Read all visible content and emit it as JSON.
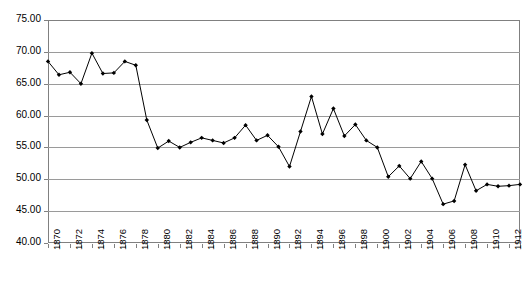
{
  "chart_data": {
    "type": "line",
    "title": "",
    "subtitle": "",
    "xlabel": "",
    "ylabel": "",
    "grid": true,
    "legend": false,
    "legend_position": "none",
    "marker": "filled-diamond",
    "line_color": "#000000",
    "marker_color": "#000000",
    "grid_color": "#9a9a9a",
    "background_color": "#ffffff",
    "xlim": [
      1870,
      1913
    ],
    "ylim": [
      40.0,
      75.0
    ],
    "ytick_step": 5,
    "xtick_label_step": 2,
    "ytick_labels": [
      "75.00",
      "70.00",
      "65.00",
      "60.00",
      "55.00",
      "50.00",
      "45.00",
      "40.00"
    ],
    "ytick_values": [
      75.0,
      70.0,
      65.0,
      60.0,
      55.0,
      50.0,
      45.0,
      40.0
    ],
    "xtick_labels": [
      "1870",
      "1872",
      "1874",
      "1876",
      "1878",
      "1880",
      "1882",
      "1884",
      "1886",
      "1888",
      "1890",
      "1892",
      "1894",
      "1896",
      "1898",
      "1900",
      "1902",
      "1904",
      "1906",
      "1908",
      "1910",
      "1912"
    ],
    "x": [
      1870,
      1871,
      1872,
      1873,
      1874,
      1875,
      1876,
      1877,
      1878,
      1879,
      1880,
      1881,
      1882,
      1883,
      1884,
      1885,
      1886,
      1887,
      1888,
      1889,
      1890,
      1891,
      1892,
      1893,
      1894,
      1895,
      1896,
      1897,
      1898,
      1899,
      1900,
      1901,
      1902,
      1903,
      1904,
      1905,
      1906,
      1907,
      1908,
      1909,
      1910,
      1911,
      1912,
      1913
    ],
    "values": [
      68.5,
      66.4,
      66.8,
      65.0,
      69.8,
      66.6,
      66.7,
      68.5,
      67.9,
      59.3,
      54.9,
      56.0,
      55.0,
      55.8,
      56.5,
      56.1,
      55.7,
      56.5,
      58.5,
      56.1,
      56.9,
      55.1,
      52.0,
      57.5,
      63.0,
      57.1,
      61.1,
      56.8,
      58.6,
      56.1,
      55.0,
      50.4,
      52.1,
      50.1,
      52.8,
      50.1,
      46.1,
      46.6,
      52.3,
      48.2,
      49.2,
      48.9,
      49.0,
      49.2
    ],
    "series": [
      {
        "name": "series-1",
        "values": [
          68.5,
          66.4,
          66.8,
          65.0,
          69.8,
          66.6,
          66.7,
          68.5,
          67.9,
          59.3,
          54.9,
          56.0,
          55.0,
          55.8,
          56.5,
          56.1,
          55.7,
          56.5,
          58.5,
          56.1,
          56.9,
          55.1,
          52.0,
          57.5,
          63.0,
          57.1,
          61.1,
          56.8,
          58.6,
          56.1,
          55.0,
          50.4,
          52.1,
          50.1,
          52.8,
          50.1,
          46.1,
          46.6,
          52.3,
          48.2,
          49.2,
          48.9,
          49.0,
          49.2
        ]
      }
    ]
  }
}
